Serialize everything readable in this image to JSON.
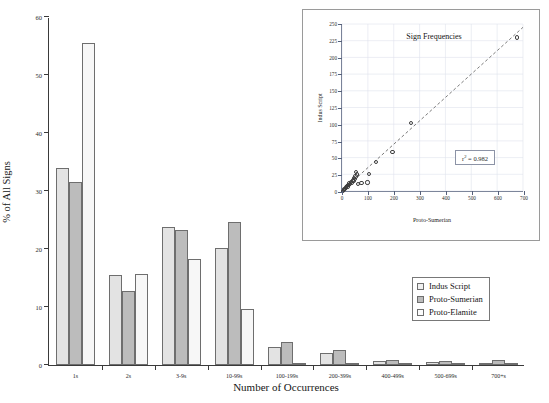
{
  "chart_data": [
    {
      "id": "main",
      "type": "bar",
      "title": "",
      "xlabel": "Number of Occurrences",
      "ylabel": "% of All Signs",
      "ylim": [
        0,
        60
      ],
      "yticks": [
        0,
        10,
        20,
        30,
        40,
        50,
        60
      ],
      "grid": false,
      "legend_position": "inside-bottom-right",
      "categories": [
        "1s",
        "2s",
        "3-9s",
        "10-99s",
        "100-199s",
        "200-399s",
        "400-499s",
        "500-699s",
        "700+s"
      ],
      "series": [
        {
          "name": "Indus Script",
          "color": "#e3e3e3",
          "values": [
            34.0,
            15.5,
            23.8,
            20.2,
            3.1,
            2.0,
            0.7,
            0.5,
            0.4
          ]
        },
        {
          "name": "Proto-Sumerian",
          "color": "#bcbcbc",
          "values": [
            31.5,
            12.8,
            23.2,
            24.6,
            3.9,
            2.6,
            0.8,
            0.7,
            0.9
          ]
        },
        {
          "name": "Proto-Elamite",
          "color": "#f7f7f7",
          "values": [
            55.5,
            15.7,
            18.3,
            9.6,
            0.4,
            0.3,
            0.2,
            0.2,
            0.2
          ]
        }
      ]
    },
    {
      "id": "inset",
      "type": "scatter",
      "title": "Sign Frequencies",
      "xlabel": "Proto-Sumerian",
      "ylabel": "Indus Script",
      "xlim": [
        0,
        700
      ],
      "ylim": [
        0,
        250
      ],
      "xticks": [
        0,
        100,
        200,
        300,
        400,
        500,
        600,
        700
      ],
      "yticks": [
        0,
        25,
        50,
        75,
        100,
        125,
        150,
        175,
        200,
        225,
        250
      ],
      "grid": true,
      "annotation": "r² = 0.982",
      "r_squared": 0.982,
      "trendline": {
        "style": "dashed",
        "x0": 0,
        "y0": 0,
        "x1": 700,
        "y1": 245
      },
      "points": [
        [
          4,
          2
        ],
        [
          7,
          3
        ],
        [
          9,
          5
        ],
        [
          12,
          4
        ],
        [
          14,
          7
        ],
        [
          16,
          6
        ],
        [
          19,
          9
        ],
        [
          21,
          8
        ],
        [
          24,
          11
        ],
        [
          26,
          10
        ],
        [
          28,
          13
        ],
        [
          31,
          12
        ],
        [
          34,
          15
        ],
        [
          38,
          14
        ],
        [
          41,
          17
        ],
        [
          44,
          16
        ],
        [
          47,
          21
        ],
        [
          50,
          19
        ],
        [
          52,
          23
        ],
        [
          55,
          30
        ],
        [
          58,
          26
        ],
        [
          62,
          12
        ],
        [
          75,
          13
        ],
        [
          98,
          14
        ],
        [
          104,
          27
        ],
        [
          132,
          45
        ],
        [
          194,
          60
        ],
        [
          266,
          103
        ],
        [
          672,
          230
        ]
      ]
    }
  ],
  "main": {
    "axis_titles": {
      "y": "% of All Signs",
      "x": "Number of Occurrences"
    },
    "ytick_labels": [
      "0",
      "10",
      "20",
      "30",
      "40",
      "50",
      "60"
    ],
    "xtick_labels": [
      "1s",
      "2s",
      "3-9s",
      "10-99s",
      "100-199s",
      "200-399s",
      "400-499s",
      "500-699s",
      "700+s"
    ],
    "legend": {
      "items": [
        {
          "label": "Indus Script",
          "swatch": "indus"
        },
        {
          "label": "Proto-Sumerian",
          "swatch": "sumerian"
        },
        {
          "label": "Proto-Elamite",
          "swatch": "elamite"
        }
      ]
    }
  },
  "inset": {
    "title": "Sign Frequencies",
    "ylabel": "Indus Script",
    "xlabel": "Proto-Sumerian",
    "ytick_labels": [
      "0",
      "25",
      "50",
      "75",
      "100",
      "125",
      "150",
      "175",
      "200",
      "225",
      "250"
    ],
    "xtick_labels": [
      "0",
      "100",
      "200",
      "300",
      "400",
      "500",
      "600",
      "700"
    ],
    "r2_prefix": "r",
    "r2_sup": "2",
    "r2_value": " = 0.982"
  },
  "colors": {
    "indus": "#e3e3e3",
    "sumerian": "#bcbcbc",
    "elamite": "#f7f7f7",
    "axis": "#3a3a3a",
    "inset_axis": "#55607a"
  }
}
